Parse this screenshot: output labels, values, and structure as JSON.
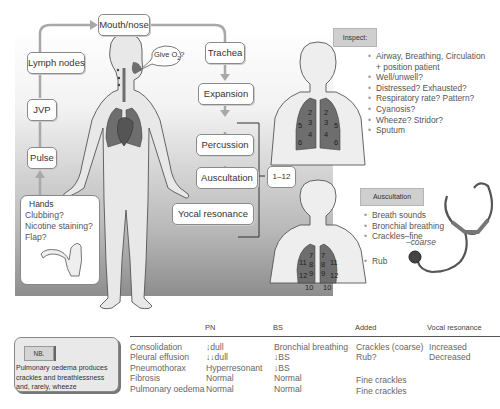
{
  "flow": {
    "mouth_nose": "Mouth/nose",
    "trachea": "Trachea",
    "expansion": "Expansion",
    "percussion": "Percussion",
    "auscultation": "Auscultation",
    "vocal_resonance": "Yocal resonance",
    "lymph_nodes": "Lymph nodes",
    "jvp": "JVP",
    "pulse": "Pulse",
    "zones": "1–12",
    "give_o2": "Give O",
    "give_o2_sub": "2",
    "give_o2_q": "?"
  },
  "hands": {
    "title": "Hands",
    "items": [
      "Clubbing?",
      "Nicotine staining?",
      "Flap?"
    ]
  },
  "inspect": {
    "title": "Inspect:",
    "items": [
      {
        "text": "Airway, Breathing, Circulation",
        "cont": false
      },
      {
        "text": "+ position patient",
        "cont": true
      },
      {
        "text": "Well/unwell?",
        "cont": false
      },
      {
        "text": "Distressed? Exhausted?",
        "cont": false
      },
      {
        "text": "Respiratory rate? Pattern?",
        "cont": false
      },
      {
        "text": "Cyanosis?",
        "cont": false
      },
      {
        "text": "Wheeze? Stridor?",
        "cont": false
      },
      {
        "text": "Sputum",
        "cont": false
      }
    ]
  },
  "auscultation_box": {
    "title": "Auscultation",
    "items": [
      "Breath sounds",
      "Bronchial breathing",
      "Crackles–fine"
    ],
    "coarse": "–coarse",
    "rub": "Rub"
  },
  "front_lungs": {
    "left": [
      "2",
      "3",
      "4",
      "5",
      "6"
    ],
    "right": [
      "2",
      "3",
      "4",
      "5",
      "6"
    ]
  },
  "back_lungs": {
    "left": [
      "7",
      "8",
      "9",
      "10",
      "11",
      "12"
    ],
    "right": [
      "7",
      "8",
      "9",
      "10",
      "11",
      "12"
    ]
  },
  "nb": {
    "tag": "NB.",
    "text": "Pulmonary oedema produces crackles and breathlessness and, rarely, wheeze"
  },
  "table": {
    "headers": [
      "",
      "PN",
      "BS",
      "Added",
      "Vocal resonance"
    ],
    "rows": [
      [
        "Consolidation",
        "↓dull",
        "Bronchial breathing",
        "Crackles (coarse)",
        "Increased"
      ],
      [
        "Pleural effusion",
        "↓↓dull",
        "↓BS",
        "Rub?",
        "Decreased"
      ],
      [
        "Pneumothorax",
        "Hyperresonant",
        "↓BS",
        "",
        ""
      ],
      [
        "Fibrosis",
        "Normal",
        "Normal",
        "Fine crackles",
        ""
      ],
      [
        "Pulmonary oedema",
        "Normal",
        "Normal",
        "Fine crackles",
        ""
      ]
    ]
  },
  "colors": {
    "lung": "#6e6e6e",
    "panel_dark": "#8d8d8d",
    "arrow": "#a8a8a8",
    "tag_bg": "#cfcfcf"
  }
}
